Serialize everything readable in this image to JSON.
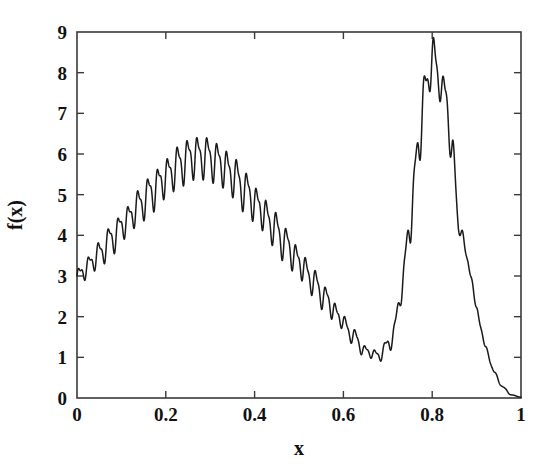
{
  "chart_data": {
    "type": "line",
    "title": "",
    "subtitle": "",
    "xlabel": "x",
    "ylabel": "f(x)",
    "xlim": [
      0,
      1
    ],
    "ylim": [
      0,
      9
    ],
    "grid": false,
    "legend": null,
    "legend_position": "none",
    "x_ticks": [
      0,
      0.2,
      0.4,
      0.6,
      0.8,
      1
    ],
    "x_tick_labels": [
      "0",
      "0.2",
      "0.4",
      "0.6",
      "0.8",
      "1"
    ],
    "y_ticks": [
      0,
      1,
      2,
      3,
      4,
      5,
      6,
      7,
      8,
      9
    ],
    "y_tick_labels": [
      "0",
      "1",
      "2",
      "3",
      "4",
      "5",
      "6",
      "7",
      "8",
      "9"
    ],
    "tick_direction": "in",
    "frame": "box",
    "line_color": "#1a1a1a",
    "series": [
      {
        "name": "f(x)",
        "description": "Oscillatory multimodal function: broad hump peaking near 6.5 around x=0.26, decaying to a shallow valley near 0.9 at x=0.66, a tall narrow spiky peak reaching 9.0 at x=0.80, then decaying to 0 at x=1.",
        "oscillation_cycles": 45,
        "envelope_x": [
          0.0,
          0.02,
          0.05,
          0.08,
          0.11,
          0.14,
          0.17,
          0.2,
          0.23,
          0.26,
          0.29,
          0.32,
          0.35,
          0.38,
          0.41,
          0.44,
          0.47,
          0.5,
          0.53,
          0.56,
          0.59,
          0.62,
          0.65,
          0.68,
          0.71,
          0.73,
          0.75,
          0.77,
          0.785,
          0.8,
          0.815,
          0.83,
          0.845,
          0.86,
          0.88,
          0.9,
          0.92,
          0.94,
          0.96,
          0.98,
          1.0
        ],
        "envelope_y": [
          2.95,
          3.2,
          3.55,
          3.95,
          4.35,
          4.75,
          5.1,
          5.45,
          5.75,
          5.95,
          5.95,
          5.8,
          5.5,
          5.1,
          4.7,
          4.25,
          3.8,
          3.35,
          2.9,
          2.45,
          2.0,
          1.55,
          1.15,
          1.05,
          1.45,
          2.6,
          4.3,
          6.3,
          7.6,
          8.4,
          7.9,
          7.4,
          6.1,
          4.3,
          3.4,
          2.2,
          1.25,
          0.62,
          0.25,
          0.07,
          0.02
        ],
        "oscillation_amplitude_x": [
          0.0,
          0.1,
          0.2,
          0.26,
          0.35,
          0.45,
          0.55,
          0.62,
          0.67,
          0.72,
          0.76,
          0.8,
          0.84,
          0.88,
          0.93,
          1.0
        ],
        "oscillation_amplitude_y": [
          0.3,
          0.45,
          0.58,
          0.62,
          0.6,
          0.52,
          0.38,
          0.22,
          0.14,
          0.3,
          0.55,
          0.7,
          0.45,
          0.18,
          0.05,
          0.0
        ],
        "key_points": [
          {
            "x": 0.0,
            "y": 2.95,
            "label": "start"
          },
          {
            "x": 0.26,
            "y": 6.55,
            "label": "left hump maximum"
          },
          {
            "x": 0.66,
            "y": 0.85,
            "label": "valley minimum"
          },
          {
            "x": 0.8,
            "y": 9.0,
            "label": "global maximum"
          },
          {
            "x": 1.0,
            "y": 0.02,
            "label": "end"
          }
        ]
      }
    ]
  },
  "axes": {
    "x_label": "x",
    "y_label": "f(x)"
  }
}
